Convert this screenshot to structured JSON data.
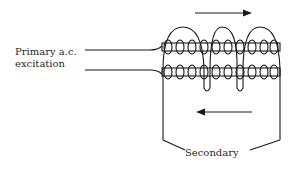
{
  "labels": {
    "primary_line1": "Primary a.c.",
    "primary_line2": "excitation",
    "secondary": "Secondary"
  },
  "colors": {
    "stroke": "#1a1a1a",
    "background": "#ffffff"
  },
  "arrows": {
    "top_direction": "right",
    "bottom_direction": "left"
  }
}
